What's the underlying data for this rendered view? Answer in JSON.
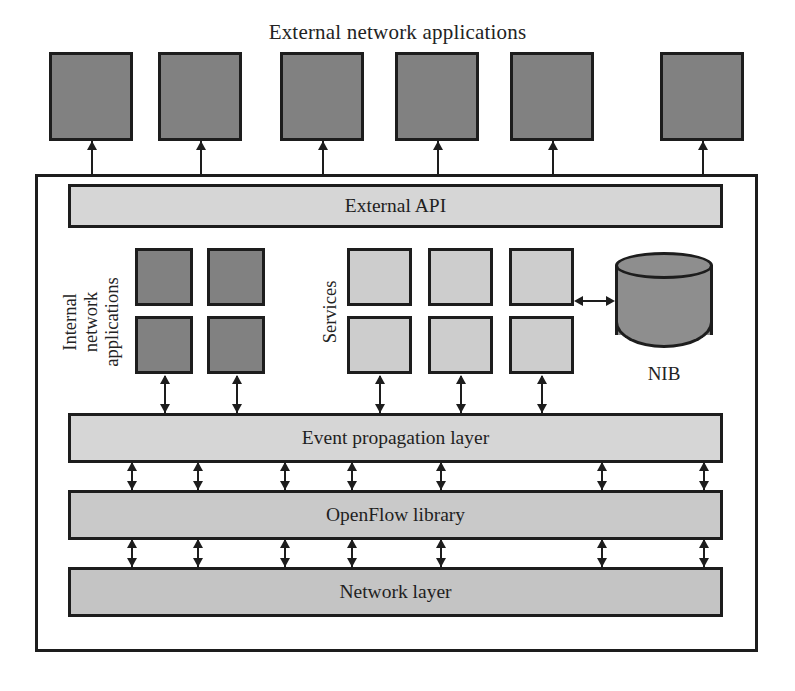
{
  "diagram": {
    "title": "External network applications",
    "type": "architecture-block-diagram"
  },
  "external_apps": {
    "label": "External network applications",
    "count": 6,
    "fill": "#818181",
    "boxes": [
      {
        "x": 49,
        "y": 52,
        "w": 84,
        "h": 89
      },
      {
        "x": 158,
        "y": 52,
        "w": 84,
        "h": 89
      },
      {
        "x": 280,
        "y": 52,
        "w": 84,
        "h": 89
      },
      {
        "x": 395,
        "y": 52,
        "w": 84,
        "h": 89
      },
      {
        "x": 510,
        "y": 52,
        "w": 84,
        "h": 89
      },
      {
        "x": 660,
        "y": 52,
        "w": 84,
        "h": 89
      }
    ]
  },
  "container": {
    "x": 35,
    "y": 174,
    "w": 723,
    "h": 478,
    "border_color": "#1d1d1d"
  },
  "external_api": {
    "label": "External API",
    "x": 68,
    "y": 184,
    "w": 655,
    "h": 44,
    "fill": "#d6d6d6"
  },
  "internal_apps": {
    "label": "Internal\nnetwork\napplications",
    "label_lines": [
      "Internal",
      "network",
      "applications"
    ],
    "count": 4,
    "fill": "#818181",
    "boxes": [
      {
        "x": 135,
        "y": 248,
        "w": 58,
        "h": 58
      },
      {
        "x": 207,
        "y": 248,
        "w": 58,
        "h": 58
      },
      {
        "x": 135,
        "y": 316,
        "w": 58,
        "h": 58
      },
      {
        "x": 207,
        "y": 316,
        "w": 58,
        "h": 58
      }
    ]
  },
  "services": {
    "label": "Services",
    "count": 6,
    "fill": "#cdcdcd",
    "boxes": [
      {
        "x": 347,
        "y": 248,
        "w": 65,
        "h": 58
      },
      {
        "x": 428,
        "y": 248,
        "w": 65,
        "h": 58
      },
      {
        "x": 509,
        "y": 248,
        "w": 65,
        "h": 58
      },
      {
        "x": 347,
        "y": 316,
        "w": 65,
        "h": 58
      },
      {
        "x": 428,
        "y": 316,
        "w": 65,
        "h": 58
      },
      {
        "x": 509,
        "y": 316,
        "w": 65,
        "h": 58
      }
    ]
  },
  "nib": {
    "label": "NIB",
    "x": 615,
    "y": 252,
    "w": 98,
    "h": 96,
    "fill": "#8e8e8e",
    "shape": "cylinder"
  },
  "layers": [
    {
      "name": "event-propagation-layer",
      "label": "Event propagation layer",
      "x": 68,
      "y": 413,
      "w": 655,
      "h": 50,
      "fill": "#d6d6d6"
    },
    {
      "name": "openflow-library",
      "label": "OpenFlow library",
      "x": 68,
      "y": 490,
      "w": 655,
      "h": 50,
      "fill": "#c9c9c9"
    },
    {
      "name": "network-layer",
      "label": "Network layer",
      "x": 68,
      "y": 567,
      "w": 655,
      "h": 50,
      "fill": "#c4c4c4"
    }
  ],
  "connectors": {
    "external_api_to_apps": {
      "style": "double-headed-vertical",
      "count": 6,
      "x_positions": [
        91,
        200,
        322,
        437,
        552,
        702
      ]
    },
    "blocks_to_event_layer": {
      "style": "double-headed-vertical",
      "count": 5,
      "x_positions": [
        164,
        236,
        379,
        460,
        541
      ]
    },
    "event_to_openflow": {
      "style": "double-headed-vertical",
      "count": 7,
      "x_positions": [
        131,
        197,
        284,
        351,
        440,
        601,
        703
      ]
    },
    "openflow_to_network": {
      "style": "double-headed-vertical",
      "count": 7,
      "x_positions": [
        131,
        197,
        284,
        351,
        440,
        601,
        703
      ]
    },
    "services_to_nib": {
      "style": "double-headed-horizontal",
      "count": 1,
      "y_position": 300
    }
  },
  "palette": {
    "dark_gray": "#818181",
    "light_gray": "#cdcdcd",
    "bar_gray": "#d6d6d6",
    "cylinder_gray": "#8e8e8e",
    "stroke": "#1d1d1d",
    "background": "#ffffff"
  }
}
